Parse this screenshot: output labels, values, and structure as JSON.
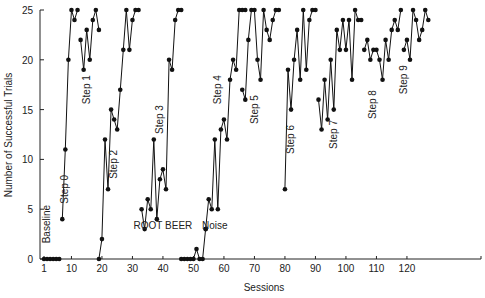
{
  "chart_data": {
    "type": "line",
    "title": "",
    "xlabel": "Sessions",
    "ylabel": "Number of Successful Trials",
    "xlim": [
      0,
      130
    ],
    "ylim": [
      0,
      25
    ],
    "x_ticks": [
      1,
      10,
      20,
      30,
      40,
      50,
      60,
      70,
      80,
      90,
      100,
      110,
      120
    ],
    "y_ticks": [
      0,
      5,
      10,
      15,
      20,
      25
    ],
    "grid": false,
    "legend": null,
    "marker": "filled-circle",
    "color": "#111111",
    "series": [
      {
        "name": "Baseline",
        "x": [
          1,
          2,
          3,
          4,
          5,
          6
        ],
        "values": [
          0,
          0,
          0,
          0,
          0,
          0
        ]
      },
      {
        "name": "Step 0",
        "x": [
          7,
          8,
          9,
          10,
          11,
          12
        ],
        "values": [
          4,
          11,
          20,
          25,
          24,
          25
        ]
      },
      {
        "name": "Step 1",
        "x": [
          13,
          14,
          15,
          16,
          17,
          18,
          19
        ],
        "values": [
          22,
          19,
          23,
          20,
          24,
          25,
          23
        ]
      },
      {
        "name": "Step 2",
        "x": [
          19,
          20,
          21,
          22,
          23,
          24,
          25,
          26,
          27,
          28,
          29,
          30,
          31,
          32
        ],
        "values": [
          0,
          2,
          12,
          7,
          15,
          14,
          13,
          17,
          21,
          25,
          21,
          24,
          25,
          25
        ]
      },
      {
        "name": "Step 3",
        "x": [
          33,
          34,
          35,
          36,
          37,
          38,
          39,
          40,
          41,
          42,
          43,
          44,
          45,
          46
        ],
        "values": [
          5,
          3,
          6,
          5,
          12,
          4,
          8,
          9,
          7,
          20,
          19,
          24,
          25,
          25
        ]
      },
      {
        "name": "Noise",
        "x": [
          46,
          47,
          48,
          49,
          50,
          51,
          52,
          53,
          54
        ],
        "values": [
          0,
          0,
          0,
          0,
          0,
          1,
          0,
          0,
          3
        ]
      },
      {
        "name": "Step 4",
        "x": [
          54,
          55,
          56,
          57,
          58,
          59,
          60,
          61,
          62,
          63,
          64,
          65,
          66,
          67
        ],
        "values": [
          3,
          6,
          5,
          12,
          5,
          13,
          14,
          12,
          18,
          20,
          19,
          25,
          25,
          25
        ]
      },
      {
        "name": "Step 5",
        "x": [
          66,
          67,
          68,
          69,
          70,
          71,
          72,
          73,
          74,
          75,
          76,
          77,
          78
        ],
        "values": [
          17,
          16,
          22,
          25,
          25,
          20,
          18,
          25,
          23,
          22,
          24,
          25,
          25
        ]
      },
      {
        "name": "Step 6",
        "x": [
          80,
          81,
          82,
          83,
          84,
          85,
          86,
          87,
          88,
          89,
          90
        ],
        "values": [
          7,
          19,
          15,
          20,
          23,
          18,
          25,
          19,
          24,
          25,
          25
        ]
      },
      {
        "name": "Step 7",
        "x": [
          91,
          92,
          93,
          94,
          95,
          96,
          97,
          98,
          99,
          100,
          101,
          102,
          103,
          104,
          105
        ],
        "values": [
          16,
          13,
          18,
          14,
          20,
          15,
          23,
          21,
          24,
          21,
          24,
          18,
          25,
          24,
          24
        ]
      },
      {
        "name": "Step 8",
        "x": [
          106,
          107,
          108,
          109,
          110,
          111,
          112,
          113,
          114,
          115,
          116,
          117,
          118
        ],
        "values": [
          21,
          22,
          20,
          21,
          21,
          20,
          18,
          22,
          20,
          23,
          24,
          23,
          25
        ]
      },
      {
        "name": "Step 9",
        "x": [
          119,
          120,
          121,
          122,
          123,
          124,
          125,
          126,
          127
        ],
        "values": [
          21,
          22,
          20,
          25,
          24,
          22,
          23,
          25,
          24
        ]
      }
    ],
    "annotations": [
      {
        "text": "Baseline",
        "x": 3,
        "y": 3.5,
        "rotated": true
      },
      {
        "text": "Step 0",
        "x": 9,
        "y": 7,
        "rotated": true
      },
      {
        "text": "Step 1",
        "x": 16,
        "y": 17,
        "rotated": true
      },
      {
        "text": "Step 2",
        "x": 25,
        "y": 9.5,
        "rotated": true
      },
      {
        "text": "ROOT BEER",
        "x": 40,
        "y": 3,
        "rotated": false
      },
      {
        "text": "Step 3",
        "x": 40,
        "y": 14,
        "rotated": true
      },
      {
        "text": "Noise",
        "x": 57,
        "y": 3,
        "rotated": false
      },
      {
        "text": "Step 4",
        "x": 59,
        "y": 17,
        "rotated": true
      },
      {
        "text": "Step 5",
        "x": 71,
        "y": 15,
        "rotated": true
      },
      {
        "text": "Step 6",
        "x": 83,
        "y": 12,
        "rotated": true
      },
      {
        "text": "Step 7",
        "x": 97,
        "y": 12.5,
        "rotated": true
      },
      {
        "text": "Step 8",
        "x": 110,
        "y": 15.5,
        "rotated": true
      },
      {
        "text": "Step 9",
        "x": 120,
        "y": 18,
        "rotated": true
      }
    ]
  }
}
